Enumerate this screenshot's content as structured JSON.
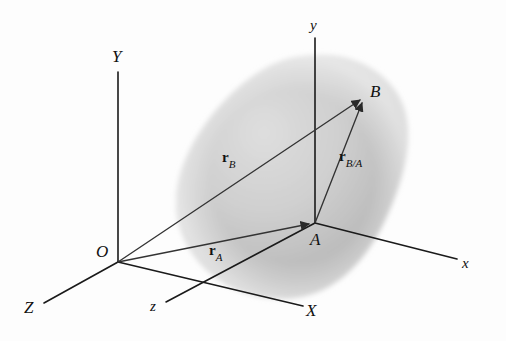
{
  "figure": {
    "kind": "engineering-vector-diagram",
    "background_color": "#fdfdfd",
    "line_color": "#1a1a1a",
    "body_fill_color": "#b8b8b8",
    "body_shade_light": "#d6d6d6",
    "body_shade_dark": "#9a9a9a"
  },
  "axes": {
    "fixed_frame": {
      "origin_label": "O",
      "items": [
        {
          "label": "Y",
          "name": "axis-label-Y-uppercase"
        },
        {
          "label": "X",
          "name": "axis-label-X-uppercase"
        },
        {
          "label": "Z",
          "name": "axis-label-Z-uppercase"
        }
      ]
    },
    "translating_frame": {
      "origin_label": "A",
      "items": [
        {
          "label": "y",
          "name": "axis-label-y-lowercase"
        },
        {
          "label": "x",
          "name": "axis-label-x-lowercase"
        },
        {
          "label": "z",
          "name": "axis-label-z-lowercase"
        }
      ]
    }
  },
  "points": [
    {
      "id": "O",
      "label": "O",
      "x": 118,
      "y": 262
    },
    {
      "id": "A",
      "label": "A",
      "x": 315,
      "y": 223
    },
    {
      "id": "B",
      "label": "B",
      "x": 365,
      "y": 95
    }
  ],
  "vectors": [
    {
      "id": "rB",
      "symbol": "r",
      "subscript": "B",
      "from": "O",
      "to": "B",
      "label_x": 228,
      "label_y": 158
    },
    {
      "id": "rA",
      "symbol": "r",
      "subscript": "A",
      "from": "O",
      "to": "A",
      "label_x": 215,
      "label_y": 251
    },
    {
      "id": "rBA",
      "symbol": "r",
      "subscript": "B/A",
      "from": "A",
      "to": "B",
      "label_x": 345,
      "label_y": 157
    }
  ],
  "labels": {
    "Y": "Y",
    "X": "X",
    "Z": "Z",
    "y": "y",
    "x": "x",
    "z": "z",
    "O": "O",
    "A": "A",
    "B": "B",
    "r": "r",
    "sub_B": "B",
    "sub_A": "A",
    "sub_BA": "B/A"
  }
}
